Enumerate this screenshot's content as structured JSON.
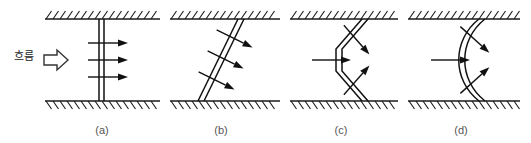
{
  "figure": {
    "background_color": "#ffffff",
    "ink_color": "#1a1a1a",
    "label_color": "#555555",
    "flow_label": "흐름",
    "flow_arrow_icon": "block-arrow-right",
    "panels": [
      {
        "id": "a",
        "label": "(a)",
        "shape": "straight-vertical-double-line",
        "description": "vertical plane normal to flow",
        "arrow_count": 3,
        "arrow_direction": "right"
      },
      {
        "id": "b",
        "label": "(b)",
        "shape": "inclined-double-line",
        "description": "plane inclined to flow",
        "arrow_count": 3,
        "arrow_direction": "down-right"
      },
      {
        "id": "c",
        "label": "(c)",
        "shape": "bent-vee-double-line",
        "description": "vee bent plane apex upstream",
        "arrow_count": 3,
        "arrow_direction": "converging-right"
      },
      {
        "id": "d",
        "label": "(d)",
        "shape": "curved-arc-double-line",
        "description": "curved arc plane concave downstream",
        "arrow_count": 3,
        "arrow_direction": "radial-right"
      }
    ]
  }
}
